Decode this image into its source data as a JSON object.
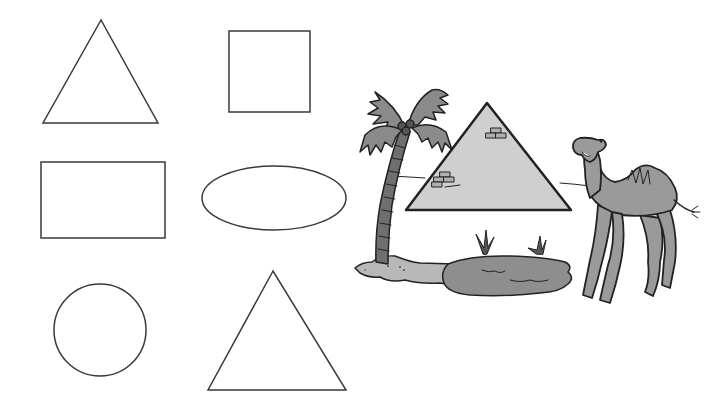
{
  "worksheet": {
    "shapes": [
      {
        "id": "triangle-1",
        "type": "triangle",
        "points": "101,20 43,123 158,123"
      },
      {
        "id": "square",
        "type": "square",
        "x": 229,
        "y": 31,
        "width": 81,
        "height": 81
      },
      {
        "id": "rectangle",
        "type": "rectangle",
        "x": 41,
        "y": 162,
        "width": 124,
        "height": 76
      },
      {
        "id": "ellipse",
        "type": "ellipse",
        "cx": 274,
        "cy": 198,
        "rx": 72,
        "ry": 32
      },
      {
        "id": "circle",
        "type": "circle",
        "cx": 100,
        "cy": 330,
        "r": 46
      },
      {
        "id": "triangle-2",
        "type": "triangle",
        "points": "273,271 208,390 346,390"
      }
    ],
    "scene": {
      "description": "Desert scene with palm tree, pyramid, oasis and camel",
      "elements": [
        "palm-tree",
        "pyramid",
        "oasis",
        "grass",
        "camel"
      ]
    },
    "colors": {
      "outline": "#333333",
      "pyramid_fill": "#cfcfcf",
      "foliage": "#8a8a8a",
      "trunk": "#6f6f6f",
      "sand": "#b5b5b5",
      "water": "#8e8e8e",
      "camel": "#9a9a9a",
      "background": "#ffffff"
    }
  }
}
